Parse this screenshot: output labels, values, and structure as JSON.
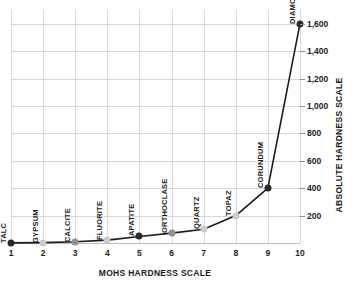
{
  "chart_data": {
    "type": "line",
    "title": "",
    "xlabel": "MOHS HARDNESS SCALE",
    "ylabel": "ABSOLUTE HARDNESS SCALE",
    "xlim": [
      1,
      10
    ],
    "ylim": [
      0,
      1700
    ],
    "grid": true,
    "legend": false,
    "x": [
      1,
      2,
      3,
      4,
      5,
      6,
      7,
      8,
      9,
      10
    ],
    "values": [
      1,
      3,
      9,
      21,
      48,
      72,
      100,
      200,
      400,
      1600
    ],
    "xticklabels": [
      "1",
      "2",
      "3",
      "4",
      "5",
      "6",
      "7",
      "8",
      "9",
      "10"
    ],
    "yticks": [
      200,
      400,
      600,
      800,
      1000,
      1200,
      1400,
      1600
    ],
    "yticklabels": [
      "200",
      "400",
      "600",
      "800",
      "1,000",
      "1,200",
      "1,400",
      "1,600"
    ],
    "point_labels": [
      "TALC",
      "GYPSUM",
      "CALCITE",
      "FLUORITE",
      "APATITE",
      "ORTHOCLASE",
      "QUARTZ",
      "TOPAZ",
      "CORUNDUM",
      "DIAMOND"
    ],
    "marker_colors": [
      "#2b2b2b",
      "#c9cbcd",
      "#8d9093",
      "#c9cbcd",
      "#2b2b2b",
      "#8d9093",
      "#c9cbcd",
      "#c9cbcd",
      "#2b2b2b",
      "#2b2b2b"
    ],
    "line_color": "#1b1b1b",
    "grid_color": "#d6d8da",
    "text_color": "#1b1b1b"
  }
}
